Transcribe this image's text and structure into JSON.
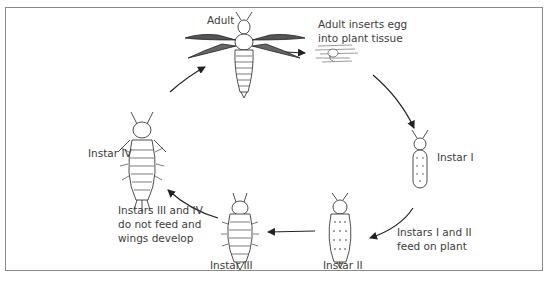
{
  "diagram": {
    "stages": [
      {
        "id": "adult",
        "label": "Adult"
      },
      {
        "id": "egg",
        "label": "Adult inserts egg\ninto plant tissue"
      },
      {
        "id": "instar1",
        "label": "Instar I"
      },
      {
        "id": "instar2",
        "label": "Instar II"
      },
      {
        "id": "instar3",
        "label": "Instar III"
      },
      {
        "id": "instar4",
        "label": "Instar IV"
      }
    ],
    "notes": {
      "feeding": "Instars I and II\nfeed on plant",
      "nonfeeding": "Instars III and IV\ndo not feed and\nwings develop"
    },
    "cycle_order": [
      "adult",
      "egg",
      "instar1",
      "instar2",
      "instar3",
      "instar4",
      "adult"
    ]
  }
}
